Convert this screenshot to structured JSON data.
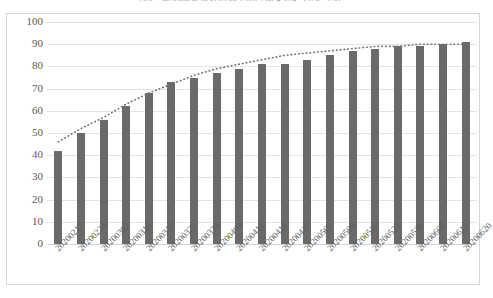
{
  "chart_data": {
    "type": "bar",
    "title": "图1　新冠肺炎累计治愈率随时间变化趋势图（%）",
    "xlabel": "",
    "ylabel": "",
    "ylim": [
      0,
      100
    ],
    "ytick_step": 10,
    "ytick_labels": [
      "100",
      "90",
      "80",
      "70",
      "60",
      "50",
      "40",
      "30",
      "20",
      "10",
      "0"
    ],
    "grid": true,
    "legend": "none",
    "categories": [
      "20200217",
      "20200224",
      "20200302",
      "20200310",
      "20200316",
      "20200323",
      "20200330",
      "20200404",
      "20200411",
      "20200418",
      "20200425",
      "20200502",
      "20200509",
      "20200516",
      "20200523",
      "20200530",
      "20200606",
      "20200613",
      "20200620"
    ],
    "series": [
      {
        "name": "累计治愈率",
        "type": "bar",
        "color": "#6a6a6a",
        "values": [
          42,
          50,
          56,
          62,
          68,
          73,
          75,
          77,
          79,
          81,
          81,
          83,
          85,
          87,
          88,
          89,
          89,
          90,
          91
        ]
      },
      {
        "name": "趋势线",
        "type": "line",
        "style": "dotted",
        "color": "#707070",
        "values": [
          46,
          52,
          57,
          63,
          68,
          72,
          76,
          79,
          81,
          83,
          85,
          86,
          87,
          88,
          89,
          89,
          90,
          90,
          90
        ]
      }
    ]
  }
}
